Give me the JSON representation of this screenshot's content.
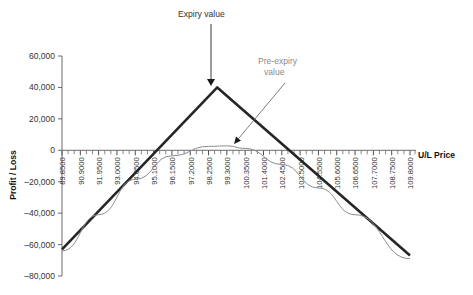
{
  "chart_data": {
    "type": "line",
    "title": "",
    "xlabel": "U/L Price",
    "ylabel": "Profit / Loss",
    "grid": false,
    "legend": "none",
    "xlim": [
      89.85,
      109.8
    ],
    "ylim": [
      -80000,
      60000
    ],
    "ytick_labels": [
      "60,000",
      "40,000",
      "20,000",
      "0",
      "–20,000",
      "–40,000",
      "–60,000",
      "–80,000"
    ],
    "ytick_values": [
      60000,
      40000,
      20000,
      0,
      -20000,
      -40000,
      -60000,
      -80000
    ],
    "xtick_labels": [
      "89.8500",
      "90.9000",
      "91.9500",
      "93.0000",
      "94.0500",
      "95.1000",
      "96.1500",
      "97.2000",
      "98.2500",
      "99.3000",
      "100.3500",
      "101.4000",
      "102.4500",
      "103.5000",
      "104.5500",
      "105.6000",
      "106.6500",
      "107.7000",
      "108.7500",
      "109.8000"
    ],
    "xtick_values": [
      89.85,
      90.9,
      91.95,
      93.0,
      94.05,
      95.1,
      96.15,
      97.2,
      98.25,
      99.3,
      100.35,
      101.4,
      102.45,
      103.5,
      104.55,
      105.6,
      106.65,
      107.7,
      108.75,
      109.8
    ],
    "series": [
      {
        "name": "Expiry value",
        "color": "#262626",
        "width": 2.6,
        "x": [
          89.85,
          98.75,
          109.8
        ],
        "values": [
          -63000,
          40000,
          -67000
        ]
      },
      {
        "name": "Pre-expiry value",
        "color": "#8c8c8c",
        "width": 1.0,
        "x": [
          89.85,
          91.95,
          94.05,
          96.15,
          98.25,
          99.3,
          100.35,
          102.45,
          104.55,
          106.65,
          109.8
        ],
        "values": [
          -64000,
          -41000,
          -18500,
          -3500,
          2500,
          2800,
          1200,
          -9000,
          -24000,
          -41000,
          -69000
        ]
      }
    ],
    "annotations": [
      {
        "name": "expiry-value",
        "text": "Expiry value",
        "color": "#333333",
        "text_x": 178,
        "text_y": 17,
        "arrow": {
          "x1": 211,
          "y1": 24,
          "x2": 211,
          "y2": 86
        }
      },
      {
        "name": "pre-expiry-value",
        "text_line1": "Pre-expiry",
        "text_line2": "value",
        "color": "#8c8c8c",
        "text_x": 258,
        "text_y": 64,
        "text_y2": 75,
        "arrow": {
          "x1": 285,
          "y1": 83,
          "x2": 234,
          "y2": 144
        }
      }
    ]
  }
}
